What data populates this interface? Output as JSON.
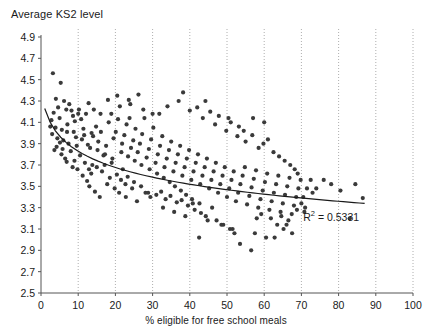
{
  "chart_data": {
    "type": "scatter",
    "title": "",
    "xlabel": "% eligible for free school meals",
    "ylabel": "Average KS2 level",
    "xlim": [
      0,
      100
    ],
    "ylim": [
      2.5,
      4.9
    ],
    "xticks": [
      0,
      10,
      20,
      30,
      40,
      50,
      60,
      70,
      80,
      90,
      100
    ],
    "yticks": [
      2.5,
      2.7,
      2.9,
      3.1,
      3.3,
      3.5,
      3.7,
      3.9,
      4.1,
      4.3,
      4.5,
      4.7,
      4.9
    ],
    "xtick_labels": [
      "0",
      "10",
      "20",
      "30",
      "40",
      "50",
      "60",
      "70",
      "80",
      "90",
      "100"
    ],
    "ytick_labels": [
      "2.5",
      "2.7",
      "2.9",
      "3.1",
      "3.3",
      "3.5",
      "3.7",
      "3.9",
      "4.1",
      "4.3",
      "4.5",
      "4.7",
      "4.9"
    ],
    "grid": "vertical-dotted",
    "grid_color": "#999999",
    "marker_color": "#3a3a3a",
    "marker_size": 2.1,
    "trendline": {
      "type": "logarithmic",
      "color": "#1a1a1a",
      "x_start": 1.0,
      "x_end": 87.0,
      "y_start": 4.23,
      "y_end": 3.34,
      "annotation": "R² = 0.5331",
      "annotation_x": 70.5,
      "annotation_y": 3.23
    },
    "legend": "none",
    "points": [
      [
        3.2,
        4.56
      ],
      [
        5.3,
        4.47
      ],
      [
        4.0,
        4.32
      ],
      [
        6.2,
        4.3
      ],
      [
        7.6,
        4.27
      ],
      [
        3.4,
        4.19
      ],
      [
        4.6,
        4.24
      ],
      [
        5.0,
        4.14
      ],
      [
        6.8,
        4.22
      ],
      [
        8.2,
        4.21
      ],
      [
        9.1,
        4.11
      ],
      [
        2.8,
        4.12
      ],
      [
        3.9,
        4.05
      ],
      [
        5.6,
        4.03
      ],
      [
        7.1,
        4.08
      ],
      [
        8.8,
        4.01
      ],
      [
        10.2,
        4.22
      ],
      [
        10.8,
        4.13
      ],
      [
        11.4,
        4.04
      ],
      [
        12.1,
        4.18
      ],
      [
        4.4,
        3.95
      ],
      [
        6.0,
        3.93
      ],
      [
        7.4,
        3.9
      ],
      [
        9.6,
        3.88
      ],
      [
        11.0,
        3.94
      ],
      [
        12.6,
        3.89
      ],
      [
        5.8,
        3.85
      ],
      [
        8.0,
        3.83
      ],
      [
        10.5,
        3.79
      ],
      [
        13.2,
        3.86
      ],
      [
        14.0,
        3.97
      ],
      [
        14.8,
        4.06
      ],
      [
        6.5,
        3.76
      ],
      [
        9.0,
        3.74
      ],
      [
        11.8,
        3.72
      ],
      [
        13.8,
        3.7
      ],
      [
        15.4,
        3.92
      ],
      [
        16.1,
        4.01
      ],
      [
        12.9,
        3.66
      ],
      [
        15.0,
        3.68
      ],
      [
        16.8,
        3.79
      ],
      [
        17.5,
        3.88
      ],
      [
        18.2,
        4.1
      ],
      [
        18.9,
        4.18
      ],
      [
        13.5,
        3.62
      ],
      [
        16.4,
        3.64
      ],
      [
        19.5,
        3.95
      ],
      [
        20.1,
        4.01
      ],
      [
        20.7,
        4.13
      ],
      [
        21.2,
        4.25
      ],
      [
        17.1,
        3.7
      ],
      [
        19.0,
        3.72
      ],
      [
        21.8,
        3.9
      ],
      [
        22.4,
        3.98
      ],
      [
        23.0,
        4.08
      ],
      [
        23.6,
        4.31
      ],
      [
        18.5,
        3.58
      ],
      [
        20.4,
        3.61
      ],
      [
        22.0,
        3.66
      ],
      [
        24.2,
        3.86
      ],
      [
        24.8,
        3.93
      ],
      [
        25.4,
        4.04
      ],
      [
        21.5,
        3.56
      ],
      [
        23.3,
        3.59
      ],
      [
        26.0,
        3.82
      ],
      [
        26.6,
        3.9
      ],
      [
        27.2,
        3.99
      ],
      [
        27.8,
        4.14
      ],
      [
        22.7,
        3.52
      ],
      [
        25.0,
        3.54
      ],
      [
        28.4,
        3.77
      ],
      [
        29.0,
        3.85
      ],
      [
        29.6,
        3.94
      ],
      [
        30.2,
        4.05
      ],
      [
        24.5,
        3.48
      ],
      [
        26.9,
        3.5
      ],
      [
        30.8,
        3.72
      ],
      [
        31.4,
        3.8
      ],
      [
        32.0,
        3.88
      ],
      [
        32.6,
        3.97
      ],
      [
        28.1,
        3.44
      ],
      [
        31.0,
        3.42
      ],
      [
        33.2,
        3.68
      ],
      [
        33.8,
        3.76
      ],
      [
        34.4,
        3.84
      ],
      [
        35.0,
        3.92
      ],
      [
        29.4,
        3.4
      ],
      [
        32.3,
        3.45
      ],
      [
        35.6,
        3.64
      ],
      [
        36.2,
        3.72
      ],
      [
        36.8,
        3.8
      ],
      [
        37.4,
        3.88
      ],
      [
        33.5,
        3.38
      ],
      [
        34.8,
        3.41
      ],
      [
        38.0,
        3.6
      ],
      [
        38.6,
        3.68
      ],
      [
        39.2,
        3.76
      ],
      [
        39.8,
        3.84
      ],
      [
        36.5,
        3.35
      ],
      [
        37.8,
        3.37
      ],
      [
        40.4,
        3.56
      ],
      [
        41.0,
        3.64
      ],
      [
        41.6,
        3.72
      ],
      [
        42.2,
        3.8
      ],
      [
        39.5,
        3.32
      ],
      [
        40.8,
        3.34
      ],
      [
        42.8,
        3.52
      ],
      [
        43.4,
        3.6
      ],
      [
        44.0,
        3.68
      ],
      [
        44.6,
        3.76
      ],
      [
        41.3,
        3.28
      ],
      [
        43.0,
        3.25
      ],
      [
        45.2,
        3.48
      ],
      [
        45.8,
        3.56
      ],
      [
        46.4,
        3.64
      ],
      [
        47.0,
        3.72
      ],
      [
        44.3,
        3.22
      ],
      [
        46.0,
        3.3
      ],
      [
        47.6,
        3.44
      ],
      [
        48.2,
        3.52
      ],
      [
        48.8,
        3.6
      ],
      [
        49.4,
        3.68
      ],
      [
        42.5,
        3.02
      ],
      [
        47.2,
        3.18
      ],
      [
        50.0,
        3.4
      ],
      [
        50.6,
        3.48
      ],
      [
        51.2,
        3.56
      ],
      [
        51.8,
        3.64
      ],
      [
        49.0,
        3.14
      ],
      [
        52.4,
        3.36
      ],
      [
        53.0,
        3.44
      ],
      [
        53.6,
        3.52
      ],
      [
        54.2,
        3.6
      ],
      [
        54.8,
        3.68
      ],
      [
        50.8,
        3.1
      ],
      [
        55.4,
        3.33
      ],
      [
        56.0,
        3.41
      ],
      [
        56.6,
        3.49
      ],
      [
        57.2,
        3.57
      ],
      [
        57.8,
        3.65
      ],
      [
        52.0,
        3.06
      ],
      [
        58.4,
        3.3
      ],
      [
        59.0,
        3.38
      ],
      [
        59.6,
        3.46
      ],
      [
        60.2,
        3.54
      ],
      [
        60.8,
        3.62
      ],
      [
        53.5,
        2.96
      ],
      [
        61.4,
        3.28
      ],
      [
        62.0,
        3.36
      ],
      [
        62.6,
        3.44
      ],
      [
        63.2,
        3.52
      ],
      [
        63.8,
        3.6
      ],
      [
        56.5,
        2.9
      ],
      [
        64.4,
        3.26
      ],
      [
        65.0,
        3.34
      ],
      [
        65.6,
        3.42
      ],
      [
        66.2,
        3.5
      ],
      [
        66.8,
        3.58
      ],
      [
        58.0,
        3.2
      ],
      [
        67.4,
        3.24
      ],
      [
        68.0,
        3.32
      ],
      [
        68.6,
        3.4
      ],
      [
        69.2,
        3.48
      ],
      [
        69.8,
        3.56
      ],
      [
        20.5,
        4.35
      ],
      [
        24.0,
        4.27
      ],
      [
        27.5,
        4.22
      ],
      [
        31.8,
        4.18
      ],
      [
        34.0,
        4.25
      ],
      [
        37.0,
        4.3
      ],
      [
        40.0,
        4.21
      ],
      [
        43.5,
        4.14
      ],
      [
        46.8,
        4.08
      ],
      [
        49.8,
        4.02
      ],
      [
        52.8,
        3.97
      ],
      [
        55.0,
        3.92
      ],
      [
        2.5,
        4.06
      ],
      [
        3.0,
        3.99
      ],
      [
        4.2,
        3.87
      ],
      [
        5.5,
        3.8
      ],
      [
        6.9,
        3.73
      ],
      [
        8.5,
        3.68
      ],
      [
        9.8,
        3.66
      ],
      [
        11.2,
        3.6
      ],
      [
        12.4,
        3.55
      ],
      [
        13.0,
        3.5
      ],
      [
        14.5,
        3.45
      ],
      [
        15.8,
        3.4
      ],
      [
        17.8,
        3.52
      ],
      [
        19.8,
        3.48
      ],
      [
        21.0,
        3.44
      ],
      [
        22.8,
        3.4
      ],
      [
        25.8,
        3.36
      ],
      [
        28.8,
        3.44
      ],
      [
        32.8,
        3.3
      ],
      [
        35.8,
        3.26
      ],
      [
        38.8,
        3.22
      ],
      [
        44.8,
        3.18
      ],
      [
        48.5,
        3.14
      ],
      [
        51.5,
        3.1
      ],
      [
        57.5,
        3.06
      ],
      [
        60.5,
        3.02
      ],
      [
        63.5,
        3.14
      ],
      [
        66.5,
        3.18
      ],
      [
        70.5,
        3.4
      ],
      [
        71.5,
        3.48
      ],
      [
        72.5,
        3.56
      ],
      [
        74.0,
        3.48
      ],
      [
        76.0,
        3.56
      ],
      [
        78.0,
        3.52
      ],
      [
        80.5,
        3.46
      ],
      [
        83.0,
        3.2
      ],
      [
        84.5,
        3.52
      ],
      [
        86.5,
        3.39
      ],
      [
        62.5,
        3.82
      ],
      [
        64.0,
        3.78
      ],
      [
        65.5,
        3.74
      ],
      [
        67.0,
        3.7
      ],
      [
        68.2,
        3.66
      ],
      [
        69.0,
        3.62
      ],
      [
        58.5,
        3.86
      ],
      [
        59.8,
        3.9
      ],
      [
        61.0,
        3.94
      ],
      [
        56.8,
        3.98
      ],
      [
        54.5,
        4.02
      ],
      [
        53.2,
        4.06
      ],
      [
        51.0,
        4.1
      ],
      [
        47.8,
        4.16
      ],
      [
        45.5,
        4.2
      ],
      [
        42.0,
        4.24
      ],
      [
        70.0,
        3.34
      ],
      [
        71.0,
        3.3
      ],
      [
        73.0,
        3.44
      ],
      [
        62.8,
        3.02
      ],
      [
        65.2,
        3.1
      ],
      [
        67.5,
        3.06
      ],
      [
        59.2,
        3.24
      ],
      [
        61.8,
        3.2
      ],
      [
        64.6,
        3.22
      ],
      [
        66.0,
        3.14
      ],
      [
        68.8,
        3.28
      ],
      [
        70.8,
        3.26
      ],
      [
        44.2,
        4.3
      ],
      [
        50.4,
        4.14
      ],
      [
        38.2,
        4.38
      ],
      [
        30.0,
        4.18
      ],
      [
        26.2,
        4.36
      ],
      [
        23.8,
        4.14
      ],
      [
        18.0,
        4.31
      ],
      [
        16.0,
        4.18
      ],
      [
        14.2,
        4.22
      ],
      [
        12.8,
        4.28
      ],
      [
        10.0,
        4.18
      ],
      [
        8.6,
        4.16
      ],
      [
        7.0,
        4.01
      ],
      [
        5.1,
        3.91
      ],
      [
        3.6,
        3.84
      ],
      [
        9.4,
        3.96
      ],
      [
        11.6,
        3.98
      ],
      [
        13.6,
        4.0
      ],
      [
        15.2,
        3.84
      ],
      [
        17.2,
        3.8
      ],
      [
        19.2,
        3.76
      ],
      [
        21.6,
        3.82
      ],
      [
        23.4,
        3.78
      ],
      [
        25.2,
        3.74
      ],
      [
        27.0,
        3.7
      ],
      [
        29.2,
        3.66
      ],
      [
        31.2,
        3.62
      ],
      [
        33.0,
        3.58
      ],
      [
        34.6,
        3.54
      ],
      [
        36.0,
        3.5
      ],
      [
        57.0,
        4.14
      ],
      [
        60.0,
        4.1
      ],
      [
        37.6,
        3.46
      ],
      [
        39.0,
        3.42
      ],
      [
        40.6,
        3.38
      ],
      [
        42.6,
        3.34
      ]
    ]
  }
}
